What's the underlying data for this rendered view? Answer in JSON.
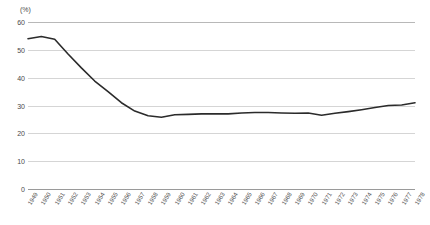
{
  "chart_data": {
    "type": "line",
    "title": "",
    "subtitle": "",
    "xlabel": "",
    "ylabel": "(%)",
    "unit_label": "(%)",
    "ylim": [
      0,
      60
    ],
    "yticks": [
      60,
      50,
      40,
      30,
      20,
      10,
      0
    ],
    "grid": true,
    "legend": "none",
    "line_color": "#2b2b2b",
    "grid_color": "#d5d5d5",
    "axis_color": "#9a9a9a",
    "text_color": "#4a4a4a",
    "categories": [
      "1949",
      "1950",
      "1951",
      "1952",
      "1953",
      "1954",
      "1955",
      "1956",
      "1957",
      "1958",
      "1959",
      "1960",
      "1961",
      "1962",
      "1963",
      "1964",
      "1965",
      "1966",
      "1967",
      "1968",
      "1969",
      "1970",
      "1971",
      "1972",
      "1973",
      "1974",
      "1975",
      "1976",
      "1977",
      "1978"
    ],
    "x": [
      1949,
      1950,
      1951,
      1952,
      1953,
      1954,
      1955,
      1956,
      1957,
      1958,
      1959,
      1960,
      1961,
      1962,
      1963,
      1964,
      1965,
      1966,
      1967,
      1968,
      1969,
      1970,
      1971,
      1972,
      1973,
      1974,
      1975,
      1976,
      1977,
      1978
    ],
    "values": [
      54.0,
      54.8,
      53.8,
      48.5,
      43.5,
      38.8,
      35.0,
      31.0,
      28.0,
      26.3,
      25.8,
      26.7,
      26.8,
      27.0,
      27.0,
      27.0,
      27.3,
      27.5,
      27.5,
      27.3,
      27.2,
      27.3,
      26.5,
      27.2,
      27.8,
      28.5,
      29.3,
      30.0,
      30.2,
      31.0
    ],
    "series": [
      {
        "name": "",
        "values": [
          54.0,
          54.8,
          53.8,
          48.5,
          43.5,
          38.8,
          35.0,
          31.0,
          28.0,
          26.3,
          25.8,
          26.7,
          26.8,
          27.0,
          27.0,
          27.0,
          27.3,
          27.5,
          27.5,
          27.3,
          27.2,
          27.3,
          26.5,
          27.2,
          27.8,
          28.5,
          29.3,
          30.0,
          30.2,
          31.0
        ]
      }
    ]
  }
}
